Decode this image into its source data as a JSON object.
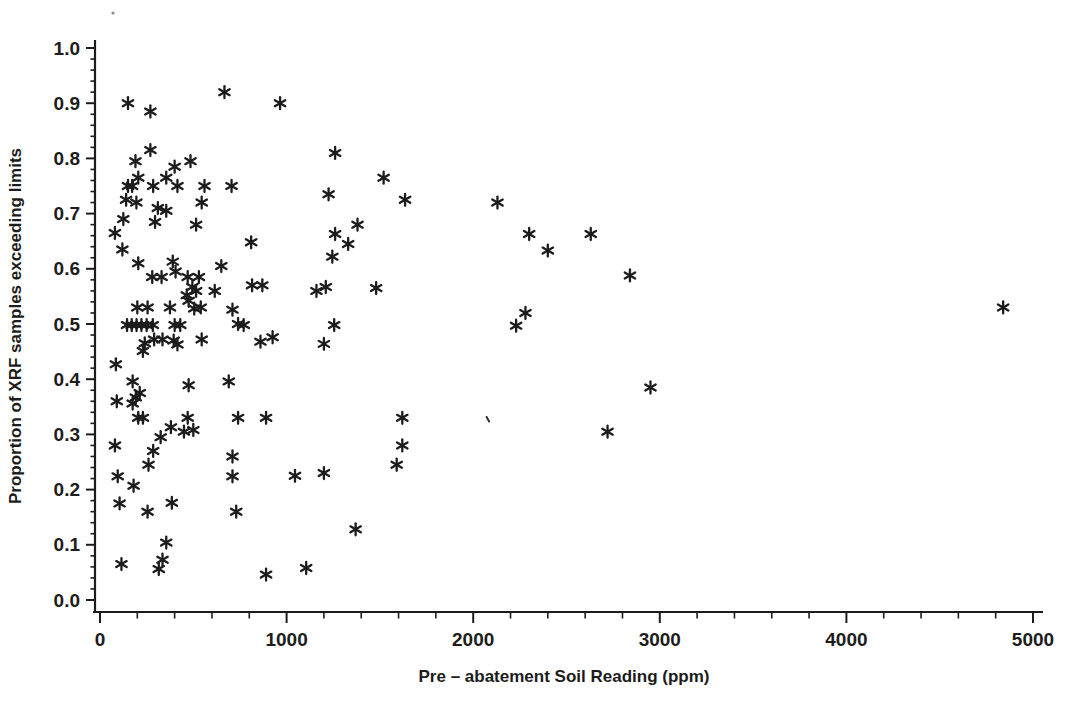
{
  "figure": {
    "width_px": 1082,
    "height_px": 717,
    "background_color": "#ffffff",
    "ink_color": "#1c1c1c"
  },
  "chart_data": {
    "type": "scatter",
    "title": "",
    "xlabel": "Pre – abatement Soil Reading (ppm)",
    "ylabel": "Proportion of XRF samples exceeding limits",
    "xlim": [
      0,
      5000
    ],
    "ylim": [
      0.0,
      1.0
    ],
    "x_ticks": [
      0,
      1000,
      2000,
      3000,
      4000,
      5000
    ],
    "y_ticks": [
      0.0,
      0.1,
      0.2,
      0.3,
      0.4,
      0.5,
      0.6,
      0.7,
      0.8,
      0.9,
      1.0
    ],
    "x_minor_tick_step": 200,
    "y_minor_tick_step": 0.02,
    "grid": false,
    "legend": null,
    "marker": "asterisk",
    "marker_color": "#1c1c1c",
    "points": [
      [
        150,
        0.9
      ],
      [
        270,
        0.885
      ],
      [
        667,
        0.92
      ],
      [
        965,
        0.9
      ],
      [
        270,
        0.815
      ],
      [
        1260,
        0.81
      ],
      [
        190,
        0.795
      ],
      [
        485,
        0.795
      ],
      [
        400,
        0.785
      ],
      [
        205,
        0.765
      ],
      [
        355,
        0.765
      ],
      [
        1520,
        0.765
      ],
      [
        150,
        0.75
      ],
      [
        172,
        0.75
      ],
      [
        285,
        0.75
      ],
      [
        415,
        0.75
      ],
      [
        560,
        0.75
      ],
      [
        705,
        0.75
      ],
      [
        140,
        0.725
      ],
      [
        195,
        0.72
      ],
      [
        545,
        0.72
      ],
      [
        1225,
        0.735
      ],
      [
        1635,
        0.725
      ],
      [
        2130,
        0.72
      ],
      [
        310,
        0.71
      ],
      [
        355,
        0.705
      ],
      [
        125,
        0.69
      ],
      [
        295,
        0.685
      ],
      [
        515,
        0.68
      ],
      [
        1380,
        0.68
      ],
      [
        80,
        0.665
      ],
      [
        1260,
        0.663
      ],
      [
        2300,
        0.663
      ],
      [
        2630,
        0.663
      ],
      [
        120,
        0.635
      ],
      [
        810,
        0.648
      ],
      [
        1330,
        0.645
      ],
      [
        2400,
        0.633
      ],
      [
        205,
        0.61
      ],
      [
        390,
        0.613
      ],
      [
        405,
        0.595
      ],
      [
        650,
        0.605
      ],
      [
        1245,
        0.622
      ],
      [
        280,
        0.585
      ],
      [
        330,
        0.585
      ],
      [
        470,
        0.585
      ],
      [
        530,
        0.585
      ],
      [
        2840,
        0.588
      ],
      [
        495,
        0.567
      ],
      [
        515,
        0.56
      ],
      [
        615,
        0.56
      ],
      [
        815,
        0.57
      ],
      [
        870,
        0.57
      ],
      [
        1160,
        0.56
      ],
      [
        1210,
        0.567
      ],
      [
        1480,
        0.565
      ],
      [
        465,
        0.552
      ],
      [
        475,
        0.542
      ],
      [
        4840,
        0.53
      ],
      [
        200,
        0.53
      ],
      [
        255,
        0.53
      ],
      [
        375,
        0.53
      ],
      [
        505,
        0.528
      ],
      [
        540,
        0.53
      ],
      [
        710,
        0.526
      ],
      [
        2280,
        0.52
      ],
      [
        145,
        0.498
      ],
      [
        170,
        0.498
      ],
      [
        196,
        0.498
      ],
      [
        222,
        0.498
      ],
      [
        250,
        0.498
      ],
      [
        283,
        0.498
      ],
      [
        400,
        0.498
      ],
      [
        430,
        0.498
      ],
      [
        740,
        0.5
      ],
      [
        770,
        0.498
      ],
      [
        1255,
        0.498
      ],
      [
        2230,
        0.497
      ],
      [
        240,
        0.465
      ],
      [
        290,
        0.472
      ],
      [
        335,
        0.472
      ],
      [
        395,
        0.47
      ],
      [
        415,
        0.463
      ],
      [
        545,
        0.472
      ],
      [
        860,
        0.468
      ],
      [
        925,
        0.476
      ],
      [
        1200,
        0.464
      ],
      [
        230,
        0.451
      ],
      [
        85,
        0.427
      ],
      [
        175,
        0.396
      ],
      [
        475,
        0.389
      ],
      [
        690,
        0.396
      ],
      [
        2950,
        0.385
      ],
      [
        213,
        0.375
      ],
      [
        90,
        0.36
      ],
      [
        175,
        0.356
      ],
      [
        192,
        0.367
      ],
      [
        205,
        0.33
      ],
      [
        230,
        0.33
      ],
      [
        470,
        0.33
      ],
      [
        740,
        0.33
      ],
      [
        890,
        0.33
      ],
      [
        1620,
        0.33
      ],
      [
        325,
        0.295
      ],
      [
        380,
        0.313
      ],
      [
        450,
        0.305
      ],
      [
        500,
        0.308
      ],
      [
        2720,
        0.305
      ],
      [
        80,
        0.28
      ],
      [
        1620,
        0.28
      ],
      [
        285,
        0.27
      ],
      [
        710,
        0.26
      ],
      [
        260,
        0.245
      ],
      [
        1590,
        0.245
      ],
      [
        95,
        0.224
      ],
      [
        710,
        0.224
      ],
      [
        1045,
        0.225
      ],
      [
        1200,
        0.23
      ],
      [
        180,
        0.207
      ],
      [
        105,
        0.175
      ],
      [
        255,
        0.16
      ],
      [
        385,
        0.176
      ],
      [
        730,
        0.16
      ],
      [
        1370,
        0.128
      ],
      [
        355,
        0.104
      ],
      [
        115,
        0.065
      ],
      [
        315,
        0.056
      ],
      [
        335,
        0.073
      ],
      [
        890,
        0.046
      ],
      [
        1105,
        0.058
      ]
    ],
    "faint_marks": [
      [
        2080,
        0.327
      ]
    ]
  },
  "artifacts": {
    "scan_specks_px": [
      [
        113,
        13
      ]
    ]
  }
}
